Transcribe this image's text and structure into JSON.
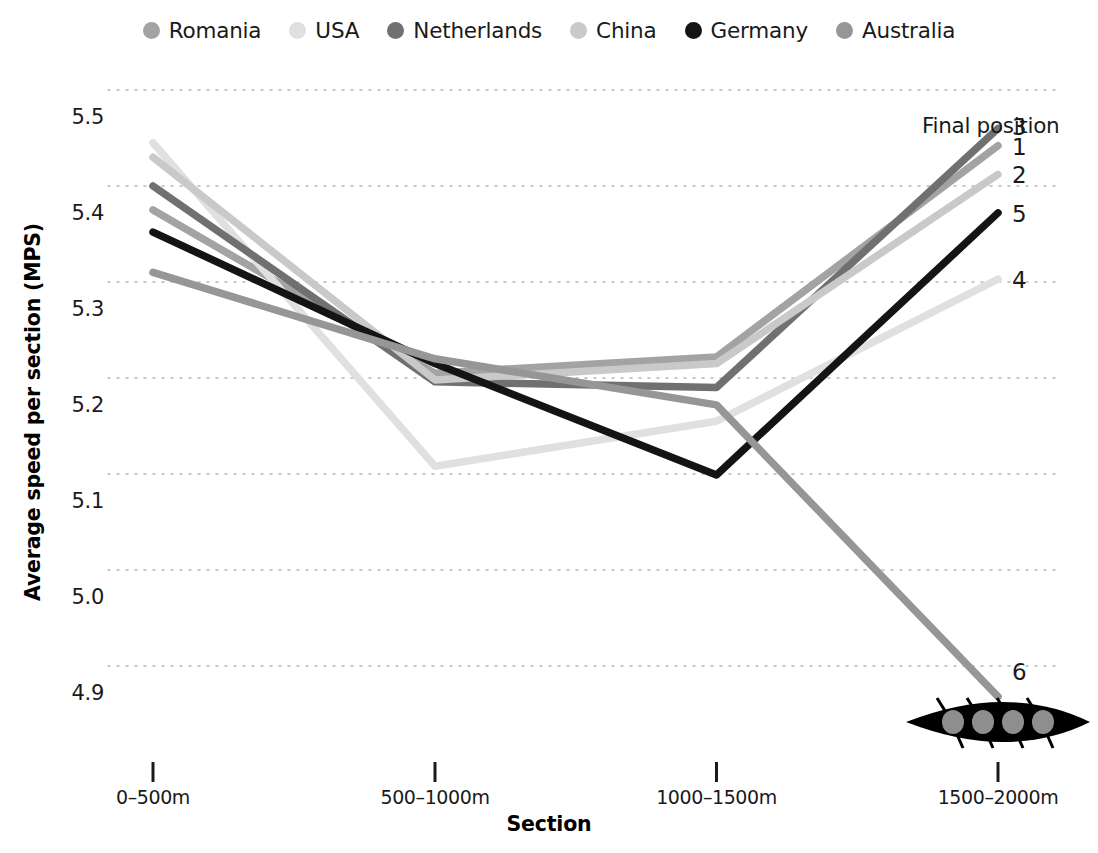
{
  "legend": {
    "items": [
      {
        "label": "Romania",
        "color": "#a3a3a3",
        "icon": "legend-dot"
      },
      {
        "label": "USA",
        "color": "#e0e0e0",
        "icon": "legend-dot"
      },
      {
        "label": "Netherlands",
        "color": "#707070",
        "icon": "legend-dot"
      },
      {
        "label": "China",
        "color": "#c9c9c9",
        "icon": "legend-dot"
      },
      {
        "label": "Germany",
        "color": "#141414",
        "icon": "legend-dot"
      },
      {
        "label": "Australia",
        "color": "#969696",
        "icon": "legend-dot"
      }
    ]
  },
  "annotations": {
    "final_position_label": "Final position",
    "boat_icon": "rowing-boat-icon",
    "rank_labels": [
      {
        "text": "3",
        "series": "Netherlands"
      },
      {
        "text": "1",
        "series": "Romania"
      },
      {
        "text": "2",
        "series": "China"
      },
      {
        "text": "5",
        "series": "Germany"
      },
      {
        "text": "4",
        "series": "USA"
      },
      {
        "text": "6",
        "series": "Australia"
      }
    ]
  },
  "chart_data": {
    "type": "line",
    "title": "",
    "xlabel": "Section",
    "ylabel": "Average speed per section (MPS)",
    "categories": [
      "0–500m",
      "500–1000m",
      "1000–1500m",
      "1500–2000m"
    ],
    "ylim": [
      4.855,
      5.545
    ],
    "yticks": [
      "5.5",
      "5.4",
      "5.3",
      "5.2",
      "5.1",
      "5.0",
      "4.9"
    ],
    "ytick_values": [
      5.5,
      5.4,
      5.3,
      5.2,
      5.1,
      5.0,
      4.9
    ],
    "grid": true,
    "grid_style": "dotted-horizontal",
    "legend_position": "top-center",
    "series": [
      {
        "name": "Romania",
        "color": "#a3a3a3",
        "final_position": "1",
        "values": [
          5.375,
          5.205,
          5.222,
          5.442
        ]
      },
      {
        "name": "USA",
        "color": "#e0e0e0",
        "final_position": "4",
        "values": [
          5.445,
          5.108,
          5.155,
          5.303
        ]
      },
      {
        "name": "Netherlands",
        "color": "#707070",
        "final_position": "3",
        "values": [
          5.4,
          5.196,
          5.19,
          5.46
        ]
      },
      {
        "name": "China",
        "color": "#c9c9c9",
        "final_position": "2",
        "values": [
          5.43,
          5.198,
          5.215,
          5.412
        ]
      },
      {
        "name": "Germany",
        "color": "#141414",
        "final_position": "5",
        "values": [
          5.352,
          5.215,
          5.099,
          5.372
        ]
      },
      {
        "name": "Australia",
        "color": "#969696",
        "final_position": "6",
        "values": [
          5.31,
          5.22,
          5.172,
          4.868
        ]
      }
    ]
  }
}
